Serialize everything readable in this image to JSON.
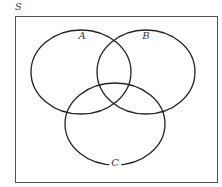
{
  "diagram": {
    "type": "venn",
    "universe": {
      "label": "S",
      "rect": {
        "x": 15,
        "y": 16,
        "width": 202,
        "height": 166
      },
      "stroke": "#555555"
    },
    "sets": [
      {
        "label": "A",
        "cx": 81,
        "cy": 72,
        "rx": 50,
        "ry": 42,
        "label_x": 82,
        "label_y": 36
      },
      {
        "label": "B",
        "cx": 146,
        "cy": 72,
        "rx": 49,
        "ry": 42,
        "label_x": 146,
        "label_y": 36
      },
      {
        "label": "C",
        "cx": 115,
        "cy": 124,
        "rx": 50,
        "ry": 41,
        "label_x": 115,
        "label_y": 163
      }
    ],
    "stroke_color": "#222222",
    "background": "#ffffff"
  }
}
